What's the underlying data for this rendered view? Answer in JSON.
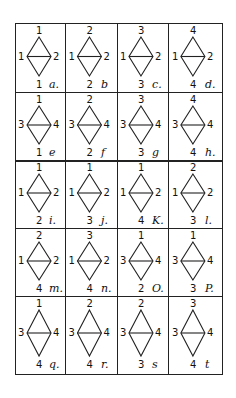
{
  "figure": {
    "rows": 5,
    "columns": 4,
    "cells": [
      {
        "label": "a.",
        "top": "1",
        "left": "1",
        "right": "2",
        "bottom": "1"
      },
      {
        "label": "b",
        "top": "2",
        "left": "1",
        "right": "2",
        "bottom": "2"
      },
      {
        "label": "c.",
        "top": "3",
        "left": "1",
        "right": "2",
        "bottom": "3"
      },
      {
        "label": "d.",
        "top": "4",
        "left": "1",
        "right": "2",
        "bottom": "4"
      },
      {
        "label": "e",
        "top": "1",
        "left": "3",
        "right": "4",
        "bottom": "1"
      },
      {
        "label": "f",
        "top": "2",
        "left": "3",
        "right": "4",
        "bottom": "2"
      },
      {
        "label": "g",
        "top": "3",
        "left": "3",
        "right": "4",
        "bottom": "3"
      },
      {
        "label": "h.",
        "top": "4",
        "left": "3",
        "right": "4",
        "bottom": "4"
      },
      {
        "label": "i.",
        "top": "1",
        "left": "1",
        "right": "2",
        "bottom": "2"
      },
      {
        "label": "j.",
        "top": "1",
        "left": "1",
        "right": "2",
        "bottom": "3"
      },
      {
        "label": "K.",
        "top": "1",
        "left": "1",
        "right": "2",
        "bottom": "4"
      },
      {
        "label": "l.",
        "top": "2",
        "left": "1",
        "right": "2",
        "bottom": "3"
      },
      {
        "label": "m.",
        "top": "2",
        "left": "1",
        "right": "2",
        "bottom": "4"
      },
      {
        "label": "n.",
        "top": "3",
        "left": "1",
        "right": "2",
        "bottom": "4"
      },
      {
        "label": "O.",
        "top": "1",
        "left": "3",
        "right": "4",
        "bottom": "2"
      },
      {
        "label": "P.",
        "top": "1",
        "left": "3",
        "right": "4",
        "bottom": "3"
      },
      {
        "label": "q.",
        "top": "1",
        "left": "3",
        "right": "4",
        "bottom": "4"
      },
      {
        "label": "r.",
        "top": "2",
        "left": "3",
        "right": "4",
        "bottom": "4"
      },
      {
        "label": "s",
        "top": "2",
        "left": "3",
        "right": "4",
        "bottom": "3"
      },
      {
        "label": "t",
        "top": "3",
        "left": "3",
        "right": "4",
        "bottom": "4"
      }
    ]
  }
}
